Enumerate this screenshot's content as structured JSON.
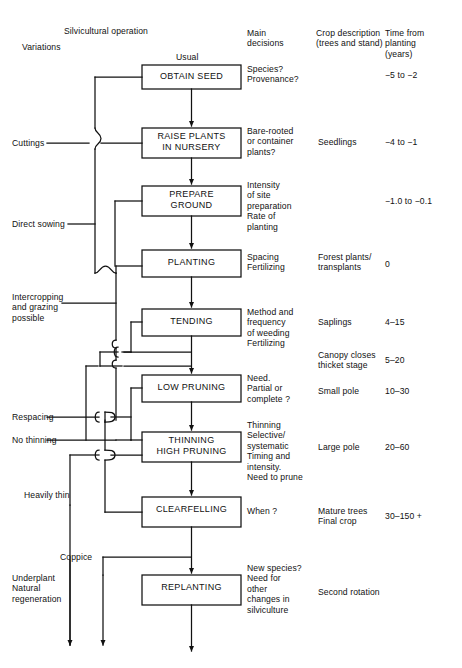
{
  "figure": {
    "title_note": "Silvicultural operations flow chart"
  },
  "headers": {
    "variations": "Variations",
    "silvicultural_operation": "Silvicultural operation",
    "usual": "Usual",
    "main_decisions": "Main\ndecisions",
    "crop_description": "Crop description\n(trees and stand)",
    "time_from_planting": "Time from\nplanting\n(years)"
  },
  "stages": [
    {
      "id": "obtain-seed",
      "box": "OBTAIN SEED",
      "decisions": "Species?\nProvenance?",
      "crop": "",
      "time": "−5 to −2"
    },
    {
      "id": "raise-plants",
      "box": "RAISE PLANTS\nIN NURSERY",
      "decisions": "Bare-rooted\nor container\nplants?",
      "crop": "Seedlings",
      "time": "−4 to −1"
    },
    {
      "id": "prepare-ground",
      "box": "PREPARE\nGROUND",
      "decisions": "Intensity\nof site\npreparation\nRate of\nplanting",
      "crop": "",
      "time": "−1.0 to −0.1"
    },
    {
      "id": "planting",
      "box": "PLANTING",
      "decisions": "Spacing\nFertilizing",
      "crop": "Forest plants/\ntransplants",
      "time": "0"
    },
    {
      "id": "tending",
      "box": "TENDING",
      "decisions": "Method and\nfrequency\nof weeding\nFertilizing",
      "crop": "Saplings",
      "time": "4–15"
    },
    {
      "id": "low-pruning",
      "box": "LOW PRUNING",
      "decisions": "Need.\nPartial or\ncomplete ?",
      "crop": "Small pole",
      "time": "10–30"
    },
    {
      "id": "thinning-high-pruning",
      "box": "THINNING\nHIGH PRUNING",
      "decisions": "Thinning\nSelective/\nsystematic\nTiming and\nintensity.\nNeed to prune",
      "crop": "Large pole",
      "time": "20–60"
    },
    {
      "id": "clearfelling",
      "box": "CLEARFELLING",
      "decisions": "When ?",
      "crop": "Mature trees\nFinal crop",
      "time": "30–150 +"
    },
    {
      "id": "replanting",
      "box": "REPLANTING",
      "decisions": "New species?\nNeed for\nother\nchanges in\nsilviculture",
      "crop": "Second rotation",
      "time": ""
    }
  ],
  "interstitial": {
    "canopy_crop": "Canopy closes\nthicket stage",
    "canopy_time": "5–20"
  },
  "variations": [
    {
      "id": "cuttings",
      "label": "Cuttings"
    },
    {
      "id": "direct-sowing",
      "label": "Direct sowing"
    },
    {
      "id": "intercropping",
      "label": "Intercropping\nand grazing\npossible"
    },
    {
      "id": "respacing",
      "label": "Respacing"
    },
    {
      "id": "no-thinning",
      "label": "No thinning"
    },
    {
      "id": "heavily-thin",
      "label": "Heavily thin"
    },
    {
      "id": "coppice",
      "label": "Coppice"
    },
    {
      "id": "underplant",
      "label": "Underplant\nNatural\nregeneration"
    }
  ],
  "colors": {
    "ink": "#111111",
    "paper": "#ffffff",
    "rule": "#1a1a1a"
  }
}
